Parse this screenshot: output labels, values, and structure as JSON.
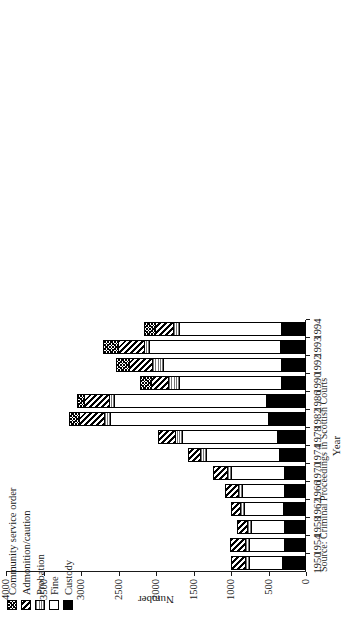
{
  "axes": {
    "value_axis_title": "Number",
    "category_axis_title": "Year",
    "value_ticks": [
      "0",
      "500",
      "1000",
      "1500",
      "2000",
      "2500",
      "3000",
      "3500",
      "4000"
    ]
  },
  "legend": {
    "items": [
      {
        "label": "Community service order",
        "pattern": "crosshatch-fine",
        "swatch": "p-cso"
      },
      {
        "label": "Admonition/caution",
        "pattern": "diagonal-hatch",
        "swatch": "p-adm"
      },
      {
        "label": "Probation",
        "pattern": "horizontal-lines",
        "swatch": "p-prob"
      },
      {
        "label": "Fine",
        "pattern": "solid-white",
        "swatch": "p-fine"
      },
      {
        "label": "Custody",
        "pattern": "solid-black",
        "swatch": "p-cust"
      }
    ]
  },
  "source": {
    "label": "Source:",
    "text": "Criminal Proceedings in Scottish Courts"
  },
  "chart_data": {
    "type": "bar",
    "orientation": "horizontal-printed-sideways",
    "stacked": true,
    "title": "",
    "xlabel": "Year",
    "ylabel": "Number",
    "ylim": [
      0,
      4000
    ],
    "grid": false,
    "legend_position": "top-left",
    "categories": [
      "1950",
      "1954",
      "1958",
      "1962",
      "1966",
      "1970",
      "1974",
      "1978",
      "1982",
      "1986",
      "1990",
      "1992",
      "1993",
      "1994"
    ],
    "series": [
      {
        "name": "Custody",
        "values": [
          320,
          300,
          300,
          310,
          290,
          300,
          360,
          390,
          510,
          540,
          330,
          340,
          350,
          330
        ]
      },
      {
        "name": "Fine",
        "values": [
          440,
          460,
          440,
          520,
          560,
          700,
          980,
          1260,
          2100,
          2020,
          1360,
          1570,
          1740,
          1360
        ]
      },
      {
        "name": "Probation",
        "values": [
          60,
          60,
          50,
          50,
          60,
          60,
          70,
          100,
          90,
          70,
          150,
          150,
          70,
          80
        ]
      },
      {
        "name": "Admonition/caution",
        "values": [
          180,
          200,
          130,
          120,
          170,
          180,
          160,
          230,
          330,
          330,
          230,
          300,
          350,
          250
        ]
      },
      {
        "name": "Community service order",
        "values": [
          0,
          0,
          0,
          0,
          0,
          0,
          0,
          0,
          130,
          90,
          140,
          180,
          200,
          140
        ]
      }
    ]
  }
}
